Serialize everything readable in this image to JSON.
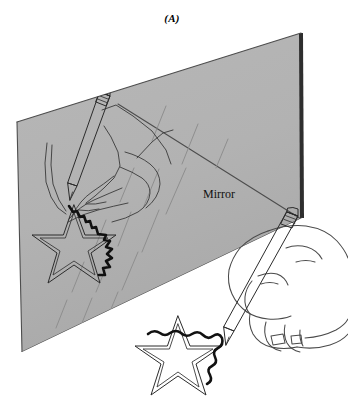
{
  "figure": {
    "panel_label": "(A)",
    "mirror_label": "Mirror",
    "caption_alt": "Mirror-tracing task: a person traces a star while viewing only the mirror reflection of their hand.",
    "colors": {
      "background": "#ffffff",
      "mirror_surface": "#b3b3b3",
      "mirror_surface_shade": "#a8a8a8",
      "mirror_edge": "#4d4d4d",
      "line_art": "#3a3a3a",
      "trace_stroke": "#111111",
      "label_text": "#111111"
    },
    "elements": {
      "mirror_panel": "mirror-surface",
      "reflected_hand": "reflected hand holding pencil",
      "reflected_star": "reflected star outline with partial traced path",
      "real_hand": "real hand holding pencil",
      "real_star": "real star outline with partial traced path",
      "glint_marks": "diagonal shine dashes on mirror"
    },
    "geometry": {
      "mirror_corner_top_right": [
        301,
        33
      ],
      "mirror_corner_top_left": [
        17,
        122
      ],
      "mirror_corner_bottom_left": [
        22,
        352
      ],
      "mirror_corner_bottom_right": [
        302,
        218
      ]
    }
  }
}
